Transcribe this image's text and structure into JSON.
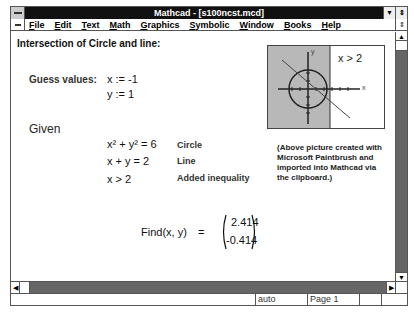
{
  "window": {
    "title": "Mathcad - [s100ncst.mcd]"
  },
  "menu": {
    "items": [
      {
        "label": "File",
        "accel": "F",
        "rest": "ile"
      },
      {
        "label": "Edit",
        "accel": "E",
        "rest": "dit"
      },
      {
        "label": "Text",
        "accel": "T",
        "rest": "ext"
      },
      {
        "label": "Math",
        "accel": "M",
        "rest": "ath"
      },
      {
        "label": "Graphics",
        "accel": "G",
        "rest": "raphics"
      },
      {
        "label": "Symbolic",
        "accel": "S",
        "rest": "ymbolic"
      },
      {
        "label": "Window",
        "accel": "W",
        "rest": "indow"
      },
      {
        "label": "Books",
        "accel": "B",
        "rest": "ooks"
      },
      {
        "label": "Help",
        "accel": "H",
        "rest": "elp"
      }
    ]
  },
  "worksheet": {
    "heading": "Intersection of Circle and line:",
    "guess_label": "Guess values:",
    "guess_x": "x := -1",
    "guess_y": "y := 1",
    "given_label": "Given",
    "equations": [
      {
        "expr_base": "x",
        "expr": "x² + y² = 6",
        "label": "Circle"
      },
      {
        "expr": "x + y = 2",
        "label": "Line"
      },
      {
        "expr": "x > 2",
        "label": "Added inequality"
      }
    ],
    "find_expr": "Find(x, y)",
    "find_eq": "=",
    "result": [
      "2.414",
      "-0.414"
    ],
    "picture_label": "x > 2",
    "picture_axis_x": "x",
    "picture_axis_y": "y",
    "picture_note": "(Above picture created with Microsoft Paintbrush and imported into Mathcad via the clipboard.)"
  },
  "status": {
    "mode": "auto",
    "page": "Page 1"
  },
  "colors": {
    "titlebar": "#111111",
    "shaded_region": "#b8b8b8",
    "scrollbar": "#666666"
  }
}
